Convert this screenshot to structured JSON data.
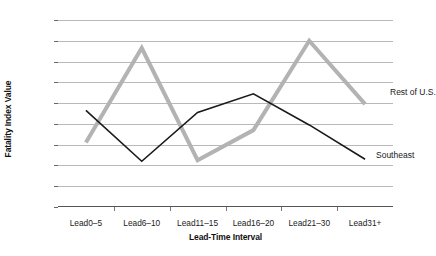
{
  "chart_data": {
    "type": "line",
    "title": "",
    "xlabel": "Lead-Time Interval",
    "ylabel": "Fatality Index Value",
    "categories": [
      "Lead0–5",
      "Lead6–10",
      "Lead11–15",
      "Lead16–20",
      "Lead21–30",
      "Lead31+"
    ],
    "ylim": [
      0,
      180
    ],
    "ytick_step": 20,
    "yticks": [
      0,
      20,
      40,
      60,
      80,
      100,
      120,
      140,
      160,
      180
    ],
    "ytick_labels": [
      "0",
      "20",
      "40",
      "60",
      "80",
      "100",
      "120",
      "140",
      "160",
      "180"
    ],
    "grid": true,
    "legend_position": "inline-annotations",
    "series": [
      {
        "name": "Rest of U.S.",
        "color": "#b3b3b3",
        "width": 4,
        "values": [
          62,
          153,
          45,
          74,
          160,
          99
        ]
      },
      {
        "name": "Southeast",
        "color": "#1a1a1a",
        "width": 1.6,
        "values": [
          93,
          44,
          91,
          109,
          79,
          46
        ]
      }
    ],
    "annotations": [
      {
        "text": "Rest of U.S.",
        "series": "Rest of U.S.",
        "x_px": 332,
        "y_px": 68
      },
      {
        "text": "Southeast",
        "series": "Southeast",
        "x_px": 318,
        "y_px": 131
      }
    ]
  }
}
